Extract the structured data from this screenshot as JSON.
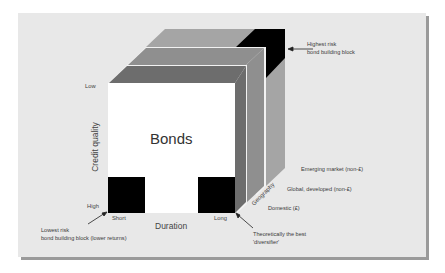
{
  "diagram": {
    "title": "Bonds",
    "axes": {
      "credit_quality": {
        "label": "Credit quality",
        "low": "Low",
        "high": "High"
      },
      "duration": {
        "label": "Duration",
        "short": "Short",
        "long": "Long"
      },
      "geography": {
        "label": "Geography",
        "levels": [
          "Domestic (£)",
          "Global, developed (non-£)",
          "Emerging market (non-£)"
        ]
      }
    },
    "annotations": {
      "highest_risk": [
        "Highest risk",
        "bond building block"
      ],
      "lowest_risk": [
        "Lowest risk",
        "bond building block (lower returns)"
      ],
      "best_diversifier": [
        "Theoretically the best",
        "'diversifier'"
      ]
    },
    "colors": {
      "panel": "#e8e8e8",
      "front_face": "#ffffff",
      "layer_domestic": "#6d6d6d",
      "layer_global": "#8f8f8f",
      "layer_emerging": "#a5a5a5",
      "block": "#000000"
    }
  }
}
